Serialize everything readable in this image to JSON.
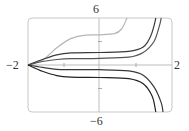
{
  "chart_data": {
    "type": "line",
    "title": "",
    "xlabel": "",
    "ylabel": "",
    "xlim": [
      -2,
      2
    ],
    "ylim": [
      -6,
      6
    ],
    "grid": false,
    "tick_labels": {
      "x_left": "−2",
      "x_right": "2",
      "y_top": "6",
      "y_bottom": "−6"
    },
    "x_ticks": [
      -1,
      1
    ],
    "y_ticks": [
      -3,
      3
    ],
    "series": [
      {
        "name": "curve-gray-top",
        "color": "#b5b5b5",
        "points": [
          [
            -2,
            0
          ],
          [
            -1.6,
            0.6
          ],
          [
            -1.2,
            2.2
          ],
          [
            -0.8,
            3.4
          ],
          [
            -0.4,
            3.8
          ],
          [
            0,
            3.85
          ],
          [
            0.4,
            4.0
          ],
          [
            0.6,
            4.6
          ],
          [
            0.75,
            6
          ]
        ]
      },
      {
        "name": "curve-upper-1",
        "color": "#3a3a3a",
        "points": [
          [
            -2,
            0
          ],
          [
            -1.6,
            0.7
          ],
          [
            -1.2,
            1.3
          ],
          [
            -0.8,
            1.55
          ],
          [
            0,
            1.6
          ],
          [
            0.8,
            1.75
          ],
          [
            1.2,
            2.3
          ],
          [
            1.4,
            3.6
          ],
          [
            1.5,
            5
          ],
          [
            1.55,
            6
          ]
        ]
      },
      {
        "name": "curve-upper-2",
        "color": "#555555",
        "points": [
          [
            -2,
            0
          ],
          [
            -1.6,
            0.45
          ],
          [
            -1.2,
            0.7
          ],
          [
            -0.8,
            0.8
          ],
          [
            0,
            0.85
          ],
          [
            0.8,
            1.0
          ],
          [
            1.2,
            1.6
          ],
          [
            1.5,
            3.0
          ],
          [
            1.65,
            5
          ],
          [
            1.7,
            6
          ]
        ]
      },
      {
        "name": "curve-lower-1",
        "color": "#3a3a3a",
        "points": [
          [
            -2,
            0
          ],
          [
            -1.6,
            -0.3
          ],
          [
            -1.2,
            -0.55
          ],
          [
            -0.8,
            -0.6
          ],
          [
            0,
            -0.6
          ],
          [
            0.8,
            -0.75
          ],
          [
            1.2,
            -1.3
          ],
          [
            1.5,
            -2.8
          ],
          [
            1.7,
            -4.8
          ],
          [
            1.75,
            -6
          ]
        ]
      },
      {
        "name": "curve-lower-2",
        "color": "#222222",
        "points": [
          [
            -2,
            0
          ],
          [
            -1.6,
            -0.8
          ],
          [
            -1.2,
            -1.35
          ],
          [
            -0.8,
            -1.55
          ],
          [
            0,
            -1.6
          ],
          [
            0.8,
            -1.75
          ],
          [
            1.2,
            -2.4
          ],
          [
            1.45,
            -4.0
          ],
          [
            1.55,
            -6
          ]
        ]
      }
    ]
  }
}
